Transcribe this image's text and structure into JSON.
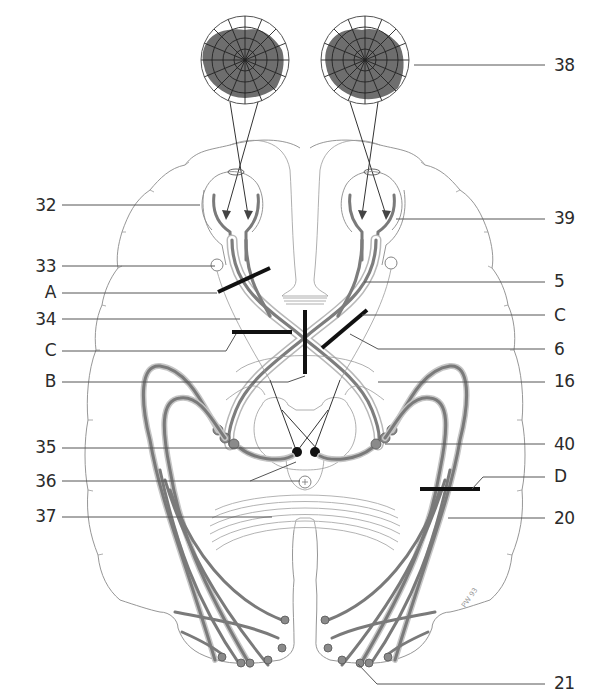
{
  "figure": {
    "visual_fields": [
      {
        "side": "left",
        "cx": 245,
        "cy": 60,
        "r": 44,
        "shaded": true
      },
      {
        "side": "right",
        "cx": 365,
        "cy": 60,
        "r": 44,
        "shaded": true
      }
    ],
    "colors": {
      "field_shade": "#6e6e6e",
      "tract": "#7d7d7d",
      "lesion_bar": "#111111",
      "outline": "#8a8a8a",
      "label_text": "#2b2b2b"
    },
    "signature": "PW 93"
  },
  "labels": {
    "left": [
      {
        "id": "l32",
        "text": "32",
        "y": 206
      },
      {
        "id": "l33",
        "text": "33",
        "y": 267
      },
      {
        "id": "lA",
        "text": "A",
        "y": 293
      },
      {
        "id": "l34",
        "text": "34",
        "y": 320
      },
      {
        "id": "lC",
        "text": "C",
        "y": 351
      },
      {
        "id": "lB",
        "text": "B",
        "y": 382
      },
      {
        "id": "l35",
        "text": "35",
        "y": 448
      },
      {
        "id": "l36",
        "text": "36",
        "y": 482
      },
      {
        "id": "l37",
        "text": "37",
        "y": 517
      }
    ],
    "right": [
      {
        "id": "r38",
        "text": "38",
        "y": 66
      },
      {
        "id": "r39",
        "text": "39",
        "y": 219
      },
      {
        "id": "r5",
        "text": "5",
        "y": 282
      },
      {
        "id": "rC",
        "text": "C",
        "y": 316
      },
      {
        "id": "r6",
        "text": "6",
        "y": 350
      },
      {
        "id": "r16",
        "text": "16",
        "y": 382
      },
      {
        "id": "r40",
        "text": "40",
        "y": 445
      },
      {
        "id": "rD",
        "text": "D",
        "y": 477
      },
      {
        "id": "r20",
        "text": "20",
        "y": 520
      },
      {
        "id": "r21",
        "text": "21",
        "y": 683
      }
    ]
  }
}
